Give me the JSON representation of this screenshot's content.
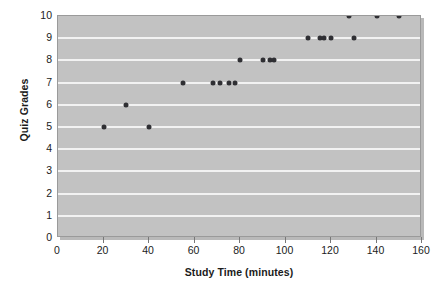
{
  "chart_data": {
    "type": "scatter",
    "title": "",
    "xlabel": "Study Time (minutes)",
    "ylabel": "Quiz Grades",
    "xlim": [
      0,
      160
    ],
    "ylim": [
      0,
      10
    ],
    "xticks": [
      0,
      20,
      40,
      60,
      80,
      100,
      120,
      140,
      160
    ],
    "yticks": [
      0,
      1,
      2,
      3,
      4,
      5,
      6,
      7,
      8,
      9,
      10
    ],
    "grid": "horizontal",
    "legend": "none",
    "marker_color": "#2f2f33",
    "plot_background": "#c2c2c2",
    "gridline_color": "#f2f2f2",
    "points": [
      {
        "x": 20,
        "y": 5
      },
      {
        "x": 30,
        "y": 6
      },
      {
        "x": 40,
        "y": 5
      },
      {
        "x": 55,
        "y": 7
      },
      {
        "x": 68,
        "y": 7
      },
      {
        "x": 71,
        "y": 7
      },
      {
        "x": 75,
        "y": 7
      },
      {
        "x": 78,
        "y": 7
      },
      {
        "x": 80,
        "y": 8
      },
      {
        "x": 90,
        "y": 8
      },
      {
        "x": 93,
        "y": 8
      },
      {
        "x": 95,
        "y": 8
      },
      {
        "x": 110,
        "y": 9
      },
      {
        "x": 115,
        "y": 9
      },
      {
        "x": 117,
        "y": 9
      },
      {
        "x": 120,
        "y": 9
      },
      {
        "x": 128,
        "y": 10
      },
      {
        "x": 130,
        "y": 9
      },
      {
        "x": 140,
        "y": 10
      },
      {
        "x": 150,
        "y": 10
      }
    ]
  }
}
